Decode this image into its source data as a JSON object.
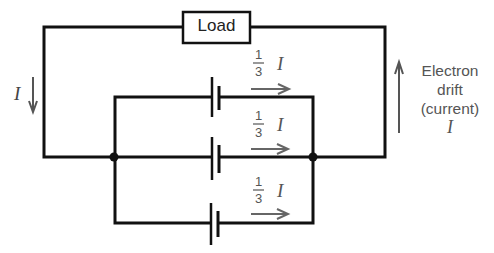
{
  "diagram": {
    "type": "circuit",
    "load_label": "Load",
    "left_current_label": "I",
    "branch_current_label": {
      "numerator": "1",
      "denominator": "3",
      "symbol": "I"
    },
    "branches": [
      {
        "name": "top-branch",
        "current": "1/3 I"
      },
      {
        "name": "middle-branch",
        "current": "1/3 I"
      },
      {
        "name": "bottom-branch",
        "current": "1/3 I"
      }
    ],
    "right_annotation": {
      "line1": "Electron",
      "line2": "drift",
      "line3": "(current)",
      "symbol": "I"
    },
    "colors": {
      "wire": "#111111",
      "annotation": "#555555"
    }
  }
}
